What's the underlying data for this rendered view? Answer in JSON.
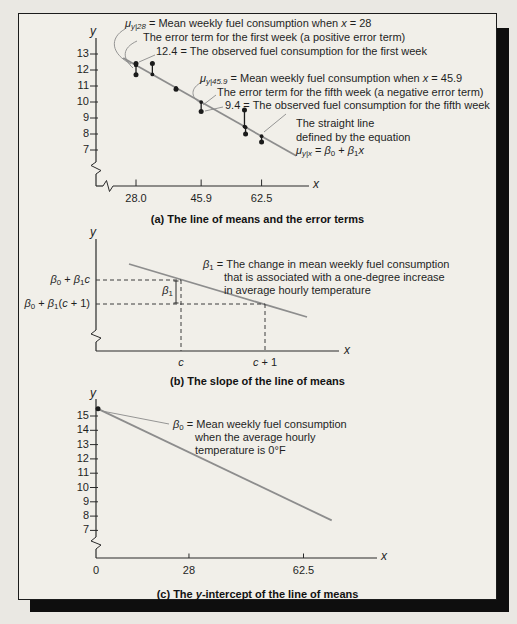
{
  "figure": {
    "a": {
      "ylabel": "y",
      "xlabel": "x",
      "mu28": [
        {
          "t": "μ",
          "i": true
        },
        {
          "t": "y|28",
          "i": true,
          "s": "sub"
        },
        {
          "t": " = Mean weekly fuel consumption when "
        },
        {
          "t": "x",
          "i": true
        },
        {
          "t": " = 28"
        }
      ],
      "err1": "The error term for the first week (a positive error term)",
      "obs1": "12.4 = The observed fuel consumption for the first week",
      "mu459": [
        {
          "t": "μ",
          "i": true
        },
        {
          "t": "y|45.9",
          "i": true,
          "s": "sub"
        },
        {
          "t": " = Mean weekly fuel consumption when "
        },
        {
          "t": "x",
          "i": true
        },
        {
          "t": " = 45.9"
        }
      ],
      "err5": "The error term for the fifth week (a negative error term)",
      "obs5": "9.4 = The observed fuel consumption for the fifth week",
      "line1": "The straight line",
      "line2": "defined by the equation",
      "line3": [
        {
          "t": "μ",
          "i": true
        },
        {
          "t": "y|x",
          "i": true,
          "s": "sub"
        },
        {
          "t": " = "
        },
        {
          "t": "β",
          "i": true
        },
        {
          "t": "0",
          "s": "sub"
        },
        {
          "t": " + "
        },
        {
          "t": "β",
          "i": true
        },
        {
          "t": "1",
          "s": "sub"
        },
        {
          "t": "x",
          "i": true
        }
      ],
      "caption": "(a) The line of means and the error terms"
    },
    "b": {
      "ylabel": "y",
      "xlabel": "x",
      "ylab1": [
        {
          "t": "β",
          "i": true
        },
        {
          "t": "0",
          "s": "sub"
        },
        {
          "t": " + "
        },
        {
          "t": "β",
          "i": true
        },
        {
          "t": "1",
          "s": "sub"
        },
        {
          "t": "c",
          "i": true
        }
      ],
      "ylab2": [
        {
          "t": "β",
          "i": true
        },
        {
          "t": "0",
          "s": "sub"
        },
        {
          "t": " + "
        },
        {
          "t": "β",
          "i": true
        },
        {
          "t": "1",
          "s": "sub"
        },
        {
          "t": "("
        },
        {
          "t": "c",
          "i": true
        },
        {
          "t": " + 1)"
        }
      ],
      "slope": [
        {
          "t": "β",
          "i": true
        },
        {
          "t": "1",
          "s": "sub"
        }
      ],
      "ann1": [
        {
          "t": "β",
          "i": true
        },
        {
          "t": "1",
          "s": "sub"
        },
        {
          "t": " = The change in mean weekly fuel consumption"
        }
      ],
      "ann2": "that is associated with a one-degree increase",
      "ann3": "in average hourly temperature",
      "xc": [
        {
          "t": "c",
          "i": true
        }
      ],
      "xc1": [
        {
          "t": "c",
          "i": true
        },
        {
          "t": " + 1"
        }
      ],
      "caption": "(b) The slope of the line of means"
    },
    "c": {
      "ylabel": "y",
      "xlabel": "x",
      "ann1": [
        {
          "t": "β",
          "i": true
        },
        {
          "t": "0",
          "s": "sub"
        },
        {
          "t": " = Mean weekly fuel consumption"
        }
      ],
      "ann2": "when the average hourly",
      "ann3": "temperature is 0°F",
      "caption": [
        {
          "t": "(c) The "
        },
        {
          "t": "y",
          "i": true
        },
        {
          "t": "-intercept of the line of means"
        }
      ]
    }
  },
  "chart_data": [
    {
      "type": "scatter",
      "title": "(a) The line of means and the error terms",
      "xlabel": "x",
      "ylabel": "y",
      "x_ticks": [
        28.0,
        45.9,
        62.5
      ],
      "x_tick_labels": [
        "28.0",
        "45.9",
        "62.5"
      ],
      "y_ticks": [
        13,
        12,
        11,
        10,
        9,
        8,
        7
      ],
      "points": [
        {
          "x": 28.0,
          "y": 12.4
        },
        {
          "x": 28.0,
          "y": 11.7
        },
        {
          "x": 32.5,
          "y": 12.4
        },
        {
          "x": 39.0,
          "y": 10.8
        },
        {
          "x": 45.9,
          "y": 9.4
        },
        {
          "x": 57.8,
          "y": 9.5
        },
        {
          "x": 58.1,
          "y": 8.0
        },
        {
          "x": 62.5,
          "y": 7.5
        }
      ],
      "line_of_means": {
        "x": [
          24.5,
          72
        ],
        "y": [
          12.75,
          6.64
        ]
      },
      "error_bars_to_line": true,
      "axis_breaks": [
        "x",
        "y"
      ]
    },
    {
      "type": "line",
      "title": "(b) The slope of the line of means",
      "xlabel": "x",
      "ylabel": "y",
      "symbolic": true,
      "x_tick_labels": [
        "c",
        "c + 1"
      ],
      "y_value_labels": [
        "β0 + β1c",
        "β0 + β1(c + 1)"
      ],
      "slope_label": "β1",
      "axis_breaks": [
        "y"
      ]
    },
    {
      "type": "line",
      "title": "(c) The y-intercept of the line of means",
      "xlabel": "x",
      "ylabel": "y",
      "x_ticks": [
        0,
        28,
        62.5
      ],
      "x_tick_labels": [
        "0",
        "28",
        "62.5"
      ],
      "y_ticks": [
        15,
        14,
        13,
        12,
        11,
        10,
        9,
        8,
        7
      ],
      "intercept_point": {
        "x": 0,
        "y": 15.5
      },
      "line": {
        "x": [
          0,
          71
        ],
        "y": [
          15.5,
          7.7
        ]
      },
      "axis_breaks": [
        "y"
      ]
    }
  ]
}
